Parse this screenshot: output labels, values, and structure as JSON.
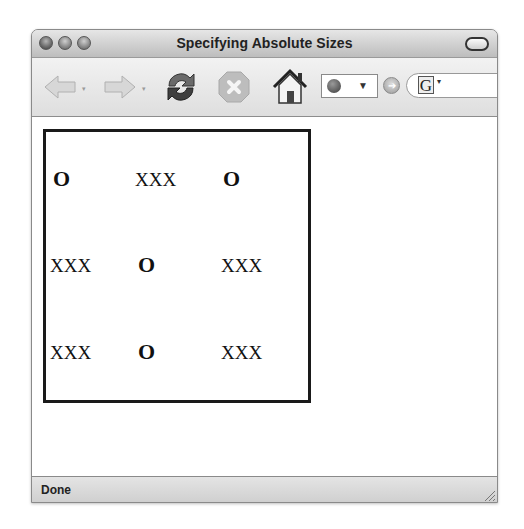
{
  "window": {
    "title": "Specifying Absolute Sizes",
    "traffic_lights": [
      "close",
      "minimize",
      "zoom"
    ]
  },
  "toolbar": {
    "back_icon": "back-arrow-icon",
    "forward_icon": "forward-arrow-icon",
    "reload_icon": "reload-icon",
    "stop_icon": "stop-icon",
    "home_icon": "home-icon",
    "url_value": "",
    "url_dropdown": "▼",
    "go_icon": "➔",
    "search_engine_label": "G",
    "search_dropdown": "▾",
    "history_dropdown": "▾"
  },
  "content": {
    "grid": [
      [
        "O",
        "XXX",
        "O"
      ],
      [
        "XXX",
        "O",
        "XXX"
      ],
      [
        "XXX",
        "O",
        "XXX"
      ]
    ],
    "box_border_color": "#1a1a1a"
  },
  "status": {
    "text": "Done"
  }
}
